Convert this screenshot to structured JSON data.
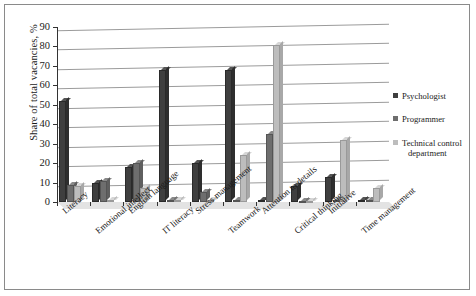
{
  "chart_data": {
    "type": "bar",
    "title": "",
    "xlabel": "",
    "ylabel": "Share of total vacancies, %",
    "ylim": [
      0,
      90
    ],
    "ytick_step": 10,
    "yticks": [
      0,
      10,
      20,
      30,
      40,
      50,
      60,
      70,
      80,
      90
    ],
    "grid": true,
    "legend_position": "right",
    "categories": [
      "Literacy",
      "Emotional intellect",
      "English language",
      "IT literacy",
      "Stress management",
      "Teamwork",
      "Attention to details",
      "Critical thinking",
      "Initiative",
      "Time management"
    ],
    "series": [
      {
        "name": "Psychologist",
        "color": "#3f3f3f",
        "values": [
          52,
          10,
          18,
          68,
          20,
          68,
          1,
          8,
          13,
          1
        ]
      },
      {
        "name": "Programmer",
        "color": "#6e6e6e",
        "values": [
          9,
          11,
          20,
          1,
          5,
          1,
          35,
          0,
          1,
          1
        ]
      },
      {
        "name": "Technical control department",
        "color": "#bdbdbd",
        "values": [
          8,
          1,
          7,
          1,
          1,
          24,
          81,
          0,
          32,
          7
        ]
      }
    ]
  },
  "axis": {
    "y_title": "Share of total vacancies, %"
  },
  "legend": {
    "entries": [
      {
        "label": "Psychologist",
        "label2": ""
      },
      {
        "label": "Programmer",
        "label2": ""
      },
      {
        "label": "Technical control",
        "label2": "department"
      }
    ]
  }
}
